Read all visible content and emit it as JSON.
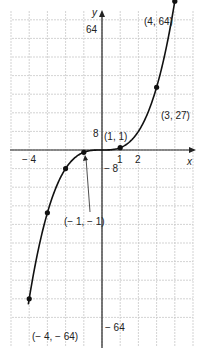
{
  "chart_data": {
    "type": "line",
    "title": "",
    "function": "y = x^3",
    "xlabel": "x",
    "ylabel": "y",
    "xlim": [
      -5,
      5
    ],
    "ylim": [
      -72,
      72
    ],
    "grid": true,
    "x_tick_labels": [
      "-4",
      "1",
      "2"
    ],
    "y_tick_labels": [
      "64",
      "8",
      "-8",
      "-64"
    ],
    "points": [
      {
        "x": -4,
        "y": -64,
        "label": "(−4, −64)"
      },
      {
        "x": -3,
        "y": -27,
        "label": ""
      },
      {
        "x": -2,
        "y": -8,
        "label": ""
      },
      {
        "x": -1,
        "y": -1,
        "label": "(−1, −1)"
      },
      {
        "x": 1,
        "y": 1,
        "label": "(1, 1)"
      },
      {
        "x": 3,
        "y": 27,
        "label": "(3, 27)"
      },
      {
        "x": 4,
        "y": 64,
        "label": "(4, 64)"
      }
    ],
    "curve_x_range": [
      -4.05,
      4.2
    ]
  },
  "labels": {
    "x_axis": "x",
    "y_axis": "y",
    "tick_y_64": "64",
    "tick_y_8": "8",
    "tick_y_neg8": "− 8",
    "tick_y_neg64": "− 64",
    "tick_x_neg4": "− 4",
    "tick_x_1": "1",
    "tick_x_2": "2",
    "pt_4_64": "(4, 64)",
    "pt_3_27": "(3, 27)",
    "pt_1_1": "(1, 1)",
    "pt_neg1_neg1": "(− 1, − 1)",
    "pt_neg4_neg64": "(− 4, − 64)"
  },
  "colors": {
    "grid": "#c8c8c8",
    "axis": "#222222",
    "curve": "#111111"
  }
}
